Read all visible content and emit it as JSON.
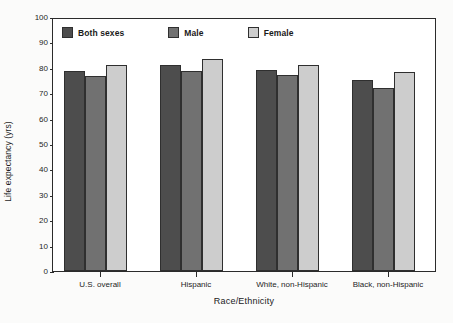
{
  "chart_data": {
    "type": "bar",
    "title": "",
    "xlabel": "Race/Ethnicity",
    "ylabel": "Life expectancy (yrs)",
    "ylim": [
      0,
      100
    ],
    "ytick_step": 10,
    "yticks": [
      100,
      90,
      80,
      70,
      60,
      50,
      40,
      30,
      20,
      10,
      0
    ],
    "grid": false,
    "legend_position": "top-inside",
    "categories": [
      "U.S. overall",
      "Hispanic",
      "White, non-Hispanic",
      "Black, non-Hispanic"
    ],
    "series": [
      {
        "name": "Both sexes",
        "color": "#4d4d4d",
        "values": [
          78.7,
          81.2,
          79.1,
          75.3
        ]
      },
      {
        "name": "Male",
        "color": "#717171",
        "values": [
          76.8,
          78.7,
          77.2,
          72.2
        ]
      },
      {
        "name": "Female",
        "color": "#cdcdcd",
        "values": [
          81.1,
          83.5,
          81.1,
          78.2
        ]
      }
    ]
  },
  "axes": {
    "y_title": "Life expectancy (yrs)",
    "x_title": "Race/Ethnicity"
  },
  "legend": {
    "items": [
      {
        "label": "Both sexes",
        "color": "#4d4d4d"
      },
      {
        "label": "Male",
        "color": "#717171"
      },
      {
        "label": "Female",
        "color": "#cdcdcd"
      }
    ]
  },
  "colors": {
    "axis": "#2b2b2b",
    "text": "#1e1e1e",
    "plot_background": "#ffffff",
    "page_background": "#fbfbfa"
  }
}
